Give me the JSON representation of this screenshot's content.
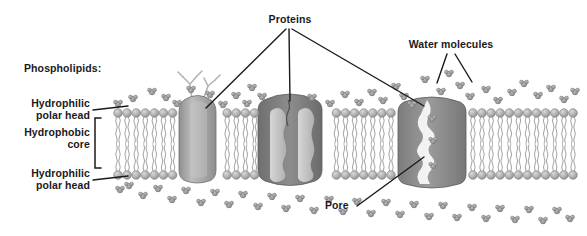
{
  "diagram": {
    "title_hidden": "Cell membrane phospholipid bilayer with membrane proteins",
    "background": "#ffffff",
    "labels": {
      "phospholipids": "Phospholipids:",
      "hydrophilic_head_top_line1": "Hydrophilic",
      "hydrophilic_head_top_line2": "polar head",
      "hydrophobic_core_line1": "Hydrophobic",
      "hydrophobic_core_line2": "core",
      "hydrophilic_head_bottom_line1": "Hydrophilic",
      "hydrophilic_head_bottom_line2": "polar head",
      "proteins": "Proteins",
      "water_molecules": "Water molecules",
      "pore": "Pore"
    },
    "colors": {
      "text": "#1a1a1a",
      "leader_line": "#1a1a1a",
      "head_fill": "#b3b3b3",
      "head_stroke": "#8a8a8a",
      "tail_stroke": "#a8a8a8",
      "protein_left": "#9a9a9a",
      "protein_center_dark": "#7a7a7a",
      "protein_center_light": "#c9c9c9",
      "protein_right": "#8c8c8c",
      "water_fill": "#9e9e9e",
      "glyco_stroke": "#b0b0b0"
    },
    "structures": [
      {
        "name": "lipid-bilayer",
        "upper_leaflet_y": 113,
        "lower_leaflet_y": 175,
        "x_start": 118,
        "x_end": 580
      },
      {
        "name": "protein-left-glycoprotein",
        "x": 196,
        "top_y": 96,
        "has_carbohydrate_chains": true
      },
      {
        "name": "protein-center-channel",
        "x": 290,
        "lobes": 2
      },
      {
        "name": "protein-right-pore",
        "x": 432,
        "has_pore": true,
        "waters_in_pore": 3
      }
    ],
    "water_positions": [
      [
        133,
        99
      ],
      [
        152,
        92
      ],
      [
        166,
        98
      ],
      [
        177,
        104
      ],
      [
        191,
        90
      ],
      [
        210,
        95
      ],
      [
        223,
        105
      ],
      [
        236,
        96
      ],
      [
        247,
        104
      ],
      [
        262,
        97
      ],
      [
        252,
        88
      ],
      [
        312,
        98
      ],
      [
        330,
        104
      ],
      [
        345,
        95
      ],
      [
        359,
        103
      ],
      [
        372,
        93
      ],
      [
        383,
        101
      ],
      [
        396,
        87
      ],
      [
        404,
        97
      ],
      [
        412,
        105
      ],
      [
        425,
        80
      ],
      [
        441,
        92
      ],
      [
        449,
        74
      ],
      [
        460,
        86
      ],
      [
        470,
        97
      ],
      [
        486,
        90
      ],
      [
        498,
        101
      ],
      [
        512,
        93
      ],
      [
        524,
        84
      ],
      [
        538,
        96
      ],
      [
        551,
        89
      ],
      [
        564,
        100
      ],
      [
        575,
        92
      ],
      [
        129,
        186
      ],
      [
        143,
        196
      ],
      [
        158,
        189
      ],
      [
        172,
        200
      ],
      [
        186,
        191
      ],
      [
        201,
        203
      ],
      [
        215,
        193
      ],
      [
        229,
        205
      ],
      [
        243,
        195
      ],
      [
        258,
        207
      ],
      [
        272,
        197
      ],
      [
        286,
        209
      ],
      [
        300,
        199
      ],
      [
        314,
        211
      ],
      [
        329,
        200
      ],
      [
        343,
        212
      ],
      [
        357,
        202
      ],
      [
        371,
        214
      ],
      [
        386,
        203
      ],
      [
        400,
        215
      ],
      [
        414,
        205
      ],
      [
        429,
        217
      ],
      [
        443,
        206
      ],
      [
        457,
        218
      ],
      [
        472,
        208
      ],
      [
        486,
        219
      ],
      [
        500,
        209
      ],
      [
        515,
        220
      ],
      [
        529,
        210
      ],
      [
        543,
        221
      ],
      [
        557,
        211
      ],
      [
        570,
        219
      ],
      [
        118,
        104
      ],
      [
        120,
        190
      ]
    ],
    "pore_waters": [
      [
        432,
        119
      ],
      [
        433,
        141
      ],
      [
        433,
        166
      ]
    ]
  }
}
